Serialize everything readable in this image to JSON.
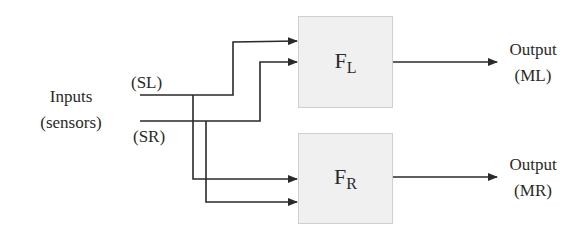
{
  "diagram": {
    "inputs_label": {
      "line1": "Inputs",
      "line2": "(sensors)"
    },
    "input_signals": [
      {
        "id": "SL",
        "label": "(SL)"
      },
      {
        "id": "SR",
        "label": "(SR)"
      }
    ],
    "blocks": [
      {
        "id": "FL",
        "main": "F",
        "sub": "L"
      },
      {
        "id": "FR",
        "main": "F",
        "sub": "R"
      }
    ],
    "outputs": [
      {
        "id": "ML",
        "line1": "Output",
        "line2": "(ML)"
      },
      {
        "id": "MR",
        "line1": "Output",
        "line2": "(MR)"
      }
    ],
    "connections": [
      {
        "from": "SL",
        "to": "FL"
      },
      {
        "from": "SR",
        "to": "FL"
      },
      {
        "from": "SL",
        "to": "FR"
      },
      {
        "from": "SR",
        "to": "FR"
      },
      {
        "from": "FL",
        "to": "ML"
      },
      {
        "from": "FR",
        "to": "MR"
      }
    ],
    "colors": {
      "line": "#2a2a2a",
      "block_fill": "#f0f0f0",
      "block_border": "#cfcfcf"
    }
  }
}
